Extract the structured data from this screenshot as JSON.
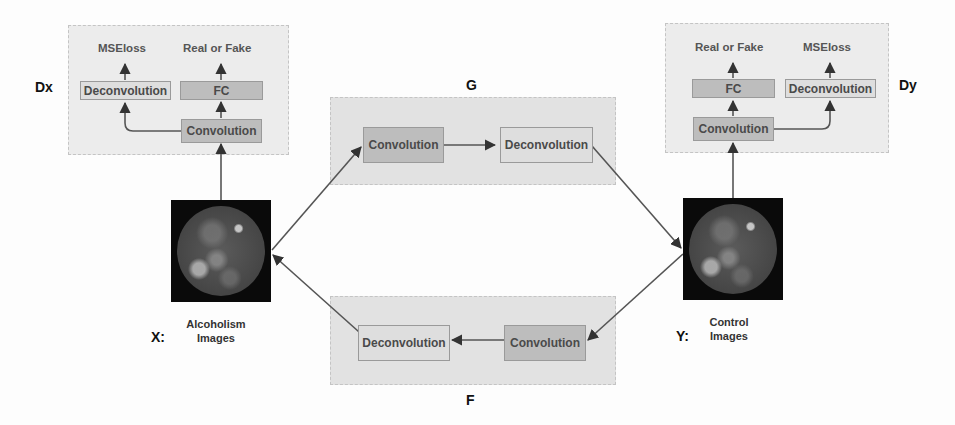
{
  "dx": {
    "label": "Dx",
    "outputs": {
      "left": "MSEloss",
      "right": "Real or Fake"
    },
    "nodes": {
      "deconvolution": "Deconvolution",
      "fc": "FC",
      "convolution": "Convolution"
    }
  },
  "dy": {
    "label": "Dy",
    "outputs": {
      "left": "Real or Fake",
      "right": "MSEloss"
    },
    "nodes": {
      "fc": "FC",
      "deconvolution": "Deconvolution",
      "convolution": "Convolution"
    }
  },
  "g": {
    "label": "G",
    "nodes": {
      "convolution": "Convolution",
      "deconvolution": "Deconvolution"
    }
  },
  "f": {
    "label": "F",
    "nodes": {
      "deconvolution": "Deconvolution",
      "convolution": "Convolution"
    }
  },
  "x_domain": {
    "prefix": "X:",
    "caption_line1": "Alcoholism",
    "caption_line2": "Images"
  },
  "y_domain": {
    "prefix": "Y:",
    "caption_line1": "Control",
    "caption_line2": "Images"
  },
  "colors": {
    "panel": "#ececec",
    "node_dark": "#bdbdbd",
    "node_light": "#dedede",
    "wire": "#555555"
  }
}
